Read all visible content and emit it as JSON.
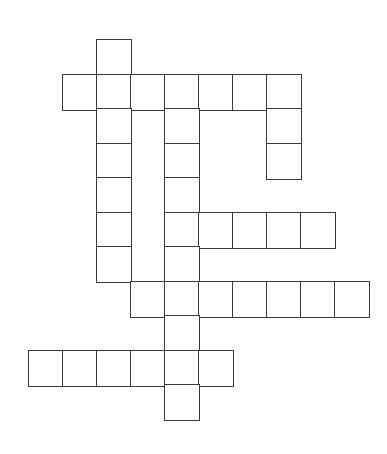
{
  "puzzle": {
    "type": "crossword",
    "cell_size": 34,
    "origin_x": 28,
    "origin_y": 39,
    "row_pitch": 34.5,
    "line_color": "#3a3a3a",
    "cells": [
      [
        0,
        2
      ],
      [
        1,
        1
      ],
      [
        1,
        2
      ],
      [
        1,
        3
      ],
      [
        1,
        4
      ],
      [
        1,
        5
      ],
      [
        1,
        6
      ],
      [
        1,
        7
      ],
      [
        2,
        2
      ],
      [
        2,
        4
      ],
      [
        2,
        7
      ],
      [
        3,
        2
      ],
      [
        3,
        4
      ],
      [
        3,
        7
      ],
      [
        4,
        2
      ],
      [
        4,
        4
      ],
      [
        5,
        2
      ],
      [
        5,
        4
      ],
      [
        5,
        5
      ],
      [
        5,
        6
      ],
      [
        5,
        7
      ],
      [
        5,
        8
      ],
      [
        6,
        2
      ],
      [
        6,
        4
      ],
      [
        7,
        3
      ],
      [
        7,
        4
      ],
      [
        7,
        5
      ],
      [
        7,
        6
      ],
      [
        7,
        7
      ],
      [
        7,
        8
      ],
      [
        7,
        9
      ],
      [
        8,
        4
      ],
      [
        9,
        0
      ],
      [
        9,
        1
      ],
      [
        9,
        2
      ],
      [
        9,
        3
      ],
      [
        9,
        4
      ],
      [
        9,
        5
      ],
      [
        10,
        4
      ]
    ]
  }
}
